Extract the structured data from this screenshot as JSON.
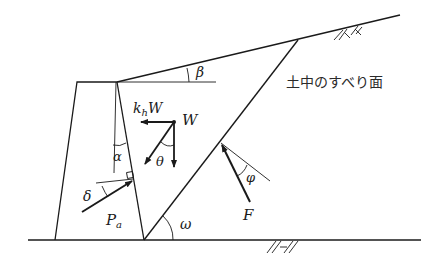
{
  "diagram": {
    "labels": {
      "slip_surface": "土中のすべり面",
      "beta": "β",
      "alpha": "α",
      "delta": "δ",
      "theta": "θ",
      "phi": "φ",
      "omega": "ω",
      "weight": "W",
      "seismic_force_k": "k",
      "seismic_force_sub": "h",
      "seismic_force_W": "W",
      "active_pressure_P": "P",
      "active_pressure_sub": "a",
      "reaction": "F"
    },
    "elements": [
      {
        "name": "retaining-wall",
        "type": "trapezoid"
      },
      {
        "name": "backfill-slope",
        "type": "line",
        "angle": "β"
      },
      {
        "name": "slip-surface",
        "type": "line",
        "angle": "ω"
      },
      {
        "name": "ground-line",
        "type": "line"
      },
      {
        "name": "weight-vector",
        "label": "W"
      },
      {
        "name": "seismic-force-vector",
        "label": "k_h W"
      },
      {
        "name": "resultant-vector",
        "angle": "θ"
      },
      {
        "name": "active-earth-pressure-vector",
        "label": "P_a",
        "angle": "δ"
      },
      {
        "name": "slip-reaction-vector",
        "label": "F",
        "angle": "φ"
      }
    ]
  }
}
